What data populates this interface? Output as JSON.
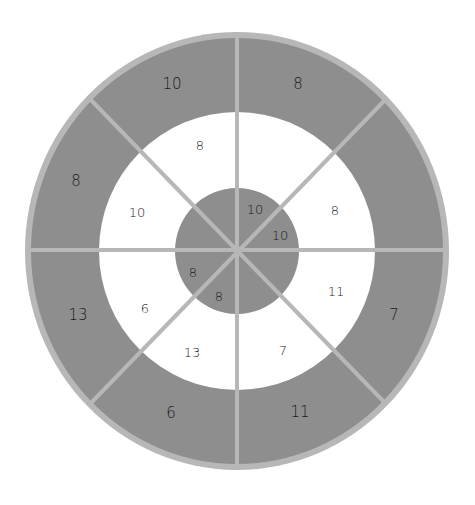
{
  "diagram": {
    "type": "concentric-ring-diagram",
    "segments": 8,
    "colors": {
      "outer_ring": "#8e8e8e",
      "middle_ring": "#ffffff",
      "inner_disc": "#8e8e8e",
      "border": "#b7b7b7",
      "dividers": "#b7b7b7",
      "text": "#1a1a1a"
    },
    "outer_ring": {
      "values": {
        "top_left": "10",
        "top_right": "8",
        "right_top": "",
        "right_bottom": "7",
        "bottom_right": "11",
        "bottom_left": "6",
        "left_bottom": "13",
        "left_top": "8"
      }
    },
    "middle_ring": {
      "values": {
        "top_left": "8",
        "top_right": "",
        "right_top": "8",
        "right_bottom": "11",
        "bottom_right": "7",
        "bottom_left": "13",
        "left_bottom": "6",
        "left_top": "10"
      }
    },
    "inner_disc": {
      "values": {
        "top_right": "10",
        "right_top": "10",
        "left_bottom": "8",
        "bottom_left": "8"
      }
    }
  }
}
